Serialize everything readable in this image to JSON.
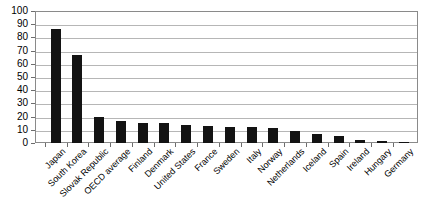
{
  "chart_data": {
    "type": "bar",
    "title": "",
    "subtitle": "",
    "xlabel": "",
    "ylabel": "",
    "ylim": [
      0,
      100
    ],
    "ytick_step": 10,
    "yticks": [
      0,
      10,
      20,
      30,
      40,
      50,
      60,
      70,
      80,
      90,
      100
    ],
    "grid": true,
    "grid_axis": "y",
    "legend": false,
    "legend_position": "none",
    "bar_color": "#131313",
    "categories": [
      "Japan",
      "South Korea",
      "Slovak Republic",
      "OECD average",
      "Finland",
      "Denmark",
      "United States",
      "France",
      "Sweden",
      "Italy",
      "Norway",
      "Netherlands",
      "Iceland",
      "Spain",
      "Ireland",
      "Hungary",
      "Germany"
    ],
    "values": [
      86,
      67,
      20,
      17,
      15,
      15,
      14,
      13,
      12.5,
      12,
      11,
      9,
      7,
      5,
      2,
      1.5,
      1
    ]
  },
  "style": {
    "axis_color": "#8a8a8a",
    "grid_color": "#b6b6b6",
    "tick_color": "#6d6d6d",
    "background": "#ffffff",
    "text_color": "#000000"
  }
}
